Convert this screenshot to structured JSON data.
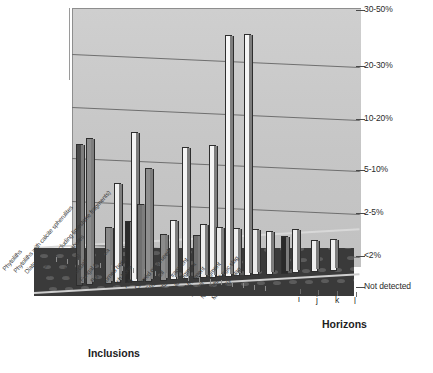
{
  "chart_data": {
    "type": "bar",
    "title": "",
    "subtitle": "",
    "xlabel": "Inclusions",
    "ylabel": "",
    "zlabel": "Horizons",
    "grid": true,
    "legend_position": "none",
    "y_axis_type": "categorical",
    "ytick_labels": [
      "Not detected",
      "<2%",
      "2-5%",
      "5-10%",
      "10-20%",
      "20-30%",
      "30-50%"
    ],
    "ylim": [
      0,
      6
    ],
    "categories": [
      "Phytoliths",
      "Phytoliths with calcite spherulites",
      "Diatoms",
      "Bioclasts (Excluding limestone fragments)",
      "Earthworm granules",
      "Shell (snail)",
      "Charcoal",
      "Fungal sclerotia",
      "Bone",
      "Burned bone",
      "Fish bone",
      "Ash",
      "Charred grain/seed",
      "Egg shell",
      "Pottery fragment",
      "Daub fragment",
      "Wall fragment",
      "Plaster fragment",
      "Non-metallurgic slag",
      "Metallurgic slag"
    ],
    "horizons": [
      "i",
      "j",
      "k",
      "l"
    ],
    "series": [
      {
        "name": "i",
        "values": [
          3,
          0,
          0,
          0,
          2,
          0,
          1,
          0,
          3,
          0,
          1,
          0,
          1,
          0,
          6,
          0,
          0,
          1,
          0,
          1
        ]
      },
      {
        "name": "j",
        "values": [
          0,
          0,
          0,
          0,
          0,
          3,
          0,
          1,
          0,
          1,
          0,
          3,
          0,
          1,
          0,
          6,
          1,
          0,
          1,
          0
        ]
      },
      {
        "name": "k",
        "values": [
          0,
          0,
          0,
          0,
          0,
          0,
          0,
          0,
          0,
          0,
          0,
          0,
          1,
          1,
          0,
          0,
          0,
          1,
          0,
          1
        ]
      },
      {
        "name": "l",
        "values": [
          0,
          0,
          0,
          0,
          0,
          0,
          0,
          0,
          0,
          0,
          0,
          0,
          0,
          0,
          0,
          0,
          0,
          0,
          0,
          0
        ]
      }
    ]
  },
  "axes": {
    "inclusions_title": "Inclusions",
    "horizons_title": "Horizons"
  },
  "ytick_labels": [
    "30-50%",
    "20-30%",
    "10-20%",
    "5-10%",
    "2-5%",
    "<2%",
    "Not detected"
  ],
  "horizon_labels": [
    "i",
    "j",
    "k",
    "l"
  ],
  "inclusion_labels": [
    "Phytoliths",
    "Phytoliths with calcite spherulites",
    "Diatoms",
    "Bioclasts (Excluding limestone fragments)",
    "Earthworm granules",
    "Shell (snail)",
    "Charcoal",
    "Fungal sclerotia",
    "Bone",
    "Burned bone",
    "Fish bone",
    "Ash",
    "Charred grain/seed",
    "Egg shell",
    "Pottery fragment",
    "Daub fragment",
    "Wall fragment",
    "Plaster fragment",
    "Non-metallurgic slag",
    "Metallurgic slag"
  ],
  "colors": {
    "wall": "#c9c9c9",
    "floor": "#3a3a3a",
    "gridline": "#6f6f6f",
    "bar_light": "#f4f4f4",
    "bar_mid": "#8e8e8e",
    "bar_dark": "#303030",
    "text": "#231f20"
  },
  "bars": [
    {
      "x": 76,
      "h": 140,
      "fill": "#4a4a4a",
      "cat": 0,
      "series": "i"
    },
    {
      "x": 86,
      "h": 145,
      "fill": "#8c8c8c",
      "cat": 0,
      "series": "i"
    },
    {
      "x": 105,
      "h": 55,
      "fill": "#8a8a8a",
      "cat": 4,
      "series": "i"
    },
    {
      "x": 114,
      "h": 98,
      "fill": "#f2f2f2",
      "cat": 5,
      "series": "j"
    },
    {
      "x": 125,
      "h": 60,
      "fill": "#2b2b2b",
      "cat": 6,
      "series": "i"
    },
    {
      "x": 131,
      "h": 148,
      "fill": "#f4f4f4",
      "cat": 7,
      "series": "j"
    },
    {
      "x": 137,
      "h": 76,
      "fill": "#707070",
      "cat": 7,
      "series": "j"
    },
    {
      "x": 145,
      "h": 112,
      "fill": "#8e8e8e",
      "cat": 8,
      "series": "i"
    },
    {
      "x": 160,
      "h": 45,
      "fill": "#8b8b8b",
      "cat": 9,
      "series": "j"
    },
    {
      "x": 170,
      "h": 58,
      "fill": "#f2f2f2",
      "cat": 10,
      "series": "i"
    },
    {
      "x": 182,
      "h": 130,
      "fill": "#f4f4f4",
      "cat": 11,
      "series": "j"
    },
    {
      "x": 193,
      "h": 42,
      "fill": "#6e6e6e",
      "cat": 12,
      "series": "i"
    },
    {
      "x": 200,
      "h": 52,
      "fill": "#ededed",
      "cat": 12,
      "series": "k"
    },
    {
      "x": 209,
      "h": 131,
      "fill": "#f4f4f4",
      "cat": 13,
      "series": "j"
    },
    {
      "x": 216,
      "h": 48,
      "fill": "#e8e8e8",
      "cat": 13,
      "series": "k"
    },
    {
      "x": 225,
      "h": 240,
      "fill": "#f6f6f6",
      "cat": 14,
      "series": "i"
    },
    {
      "x": 233,
      "h": 46,
      "fill": "#ededed",
      "cat": 14,
      "series": "j"
    },
    {
      "x": 244,
      "h": 240,
      "fill": "#f6f6f6",
      "cat": 15,
      "series": "j"
    },
    {
      "x": 252,
      "h": 44,
      "fill": "#eaeaea",
      "cat": 16,
      "series": "j"
    },
    {
      "x": 266,
      "h": 42,
      "fill": "#f0f0f0",
      "cat": 17,
      "series": "i"
    },
    {
      "x": 281,
      "h": 36,
      "fill": "#2a2a2a",
      "cat": 19,
      "series": "i"
    },
    {
      "x": 292,
      "h": 42,
      "fill": "#f0f0f0",
      "cat": 18,
      "series": "j"
    },
    {
      "x": 311,
      "h": 30,
      "fill": "#efefef",
      "cat": 19,
      "series": "k"
    },
    {
      "x": 330,
      "h": 30,
      "fill": "#efefef",
      "cat": 19,
      "series": "k"
    }
  ]
}
